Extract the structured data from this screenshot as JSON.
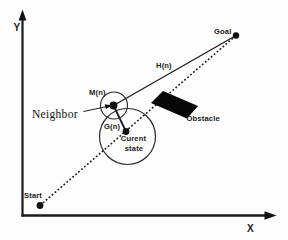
{
  "figure": {
    "background_color": "#fdfdfd",
    "ink_color": "#1b1b1b",
    "obstacle_fill": "#060606",
    "axes": {
      "x_label": "X",
      "y_label": "Y"
    },
    "nodes": {
      "start": {
        "label": "Start"
      },
      "goal": {
        "label": "Goal"
      },
      "neighbor": {
        "label": "Neighbor",
        "marker_label": "M(n)"
      },
      "current_state": {
        "label_line1": "Curent",
        "label_line2": "state"
      }
    },
    "edges": {
      "heuristic_label": "H(n)",
      "cost_label": "G(n)",
      "path_style": "dotted"
    },
    "obstacle_label": "Obstacle"
  }
}
